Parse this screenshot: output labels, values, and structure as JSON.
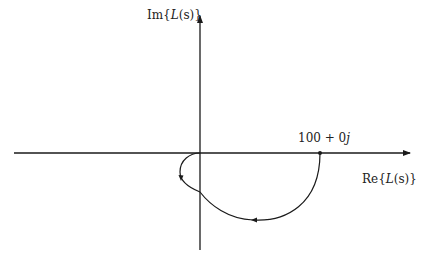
{
  "diagram": {
    "type": "nyquist-plot",
    "axes": {
      "x_label": {
        "prefix": "Re{",
        "var": "L",
        "arg": "(s)",
        "suffix": "}"
      },
      "y_label": {
        "prefix": "Im{",
        "var": "L",
        "arg": "(s)",
        "suffix": "}"
      }
    },
    "points": [
      {
        "name": "start-point",
        "label_num": "100 + 0",
        "label_j": "j",
        "re": 100,
        "im": 0
      }
    ],
    "curve": {
      "description": "Nyquist contour from 100+0j clockwise through lower half-plane, small loop near origin",
      "arrows": 2
    },
    "colors": {
      "stroke": "#1a1a1a",
      "background": "#ffffff"
    }
  }
}
